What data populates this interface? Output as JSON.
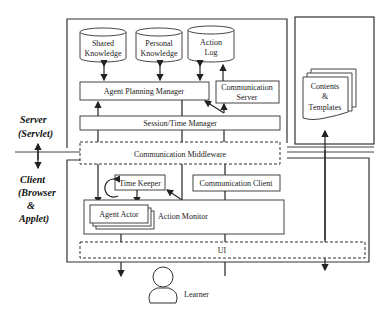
{
  "labels": {
    "server_line1": "Server",
    "server_line2": "(Servlet)",
    "client_line1": "Client",
    "client_line2": "(Browser",
    "client_line3": "&",
    "client_line4": "Applet)"
  },
  "databases": {
    "shared": [
      "Shared",
      "Knowledge"
    ],
    "personal": [
      "Personal",
      "Knowledge"
    ],
    "action_log": [
      "Action",
      "Log"
    ]
  },
  "server_components": {
    "agent_planning_manager": "Agent Planning Manager",
    "communication_server": [
      "Communication",
      "Server"
    ],
    "session_time_manager": "Session/Time Manager",
    "contents_templates": [
      "Contents",
      "&",
      "Templates"
    ]
  },
  "middleware": "Communication Middleware",
  "client_components": {
    "time_keeper": "Time Keeper",
    "communication_client": "Communication Client",
    "agent_actor": "Agent   Actor",
    "action_monitor": "Action   Monitor",
    "ui": "UI"
  },
  "user": "Learner"
}
